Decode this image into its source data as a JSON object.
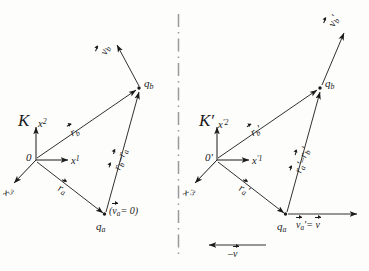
{
  "figure": {
    "divider": "vertical-dash-dot-line",
    "ink_color": "#1a1a1a",
    "background_color": "#fdfdfc"
  },
  "left_frame": {
    "name": "K",
    "axes": [
      {
        "id": "x2",
        "base": "x",
        "exponent": "2",
        "direction": "up"
      },
      {
        "id": "x1",
        "base": "x",
        "exponent": "1",
        "direction": "right"
      },
      {
        "id": "x3",
        "base": "x",
        "exponent": "3",
        "direction": "down-left"
      }
    ],
    "origin_label": "0",
    "points": [
      {
        "id": "qa",
        "base": "q",
        "sub": "a"
      },
      {
        "id": "qb",
        "base": "q",
        "sub": "b"
      }
    ],
    "vectors": [
      {
        "id": "r_b",
        "base": "r",
        "sub": "b",
        "arrow": true,
        "from": "origin",
        "to": "qb"
      },
      {
        "id": "r_a",
        "base": "r",
        "sub": "a",
        "arrow": true,
        "from": "origin",
        "to": "qa"
      },
      {
        "id": "r_b_minus_r_a",
        "expr_first": "r",
        "sub_first": "b",
        "minus": "–",
        "expr_second": "r",
        "sub_second": "a",
        "from": "qa",
        "to": "qb"
      },
      {
        "id": "v_b",
        "base": "v",
        "sub": "b",
        "arrow": true,
        "from": "qb",
        "direction": "up-left"
      }
    ],
    "note": {
      "open": "(",
      "base": "v",
      "sub": "a",
      "equals": "= 0",
      "close": ")"
    }
  },
  "right_frame": {
    "name": "K",
    "name_prime": "′",
    "axes": [
      {
        "id": "xp2",
        "base": "x",
        "prime": "′",
        "exponent": "2",
        "direction": "up"
      },
      {
        "id": "xp1",
        "base": "x",
        "prime": "′",
        "exponent": "1",
        "direction": "right"
      },
      {
        "id": "xp3",
        "base": "x",
        "prime": "′",
        "exponent": "3",
        "direction": "down-left"
      }
    ],
    "origin_label": "0",
    "origin_prime": "′",
    "points": [
      {
        "id": "qa",
        "base": "q",
        "sub": "a"
      },
      {
        "id": "qb",
        "base": "q",
        "sub": "b"
      }
    ],
    "vectors": [
      {
        "id": "r_b_prime",
        "base": "r",
        "sub": "b",
        "prime": "′",
        "arrow": true,
        "from": "origin",
        "to": "qb"
      },
      {
        "id": "r_a_prime",
        "base": "r",
        "sub": "a",
        "prime": "′",
        "arrow": true,
        "from": "origin",
        "to": "qa"
      },
      {
        "id": "r_a_minus_r_b_prime",
        "expr_first": "r",
        "sub_first": "a",
        "prime_first": "′",
        "minus": "–",
        "expr_second": "r",
        "sub_second": "b",
        "prime_second": "′",
        "from": "qa",
        "to": "qb"
      },
      {
        "id": "v_b_prime",
        "base": "v",
        "sub": "b",
        "prime": "′",
        "arrow": true,
        "from": "qb",
        "direction": "up-right"
      }
    ],
    "velocity_note": {
      "base": "v",
      "sub": "a",
      "prime": "′",
      "equals": "=",
      "rhs": "v"
    },
    "boost_label": {
      "sign": "–",
      "base": "v",
      "direction": "left"
    }
  }
}
